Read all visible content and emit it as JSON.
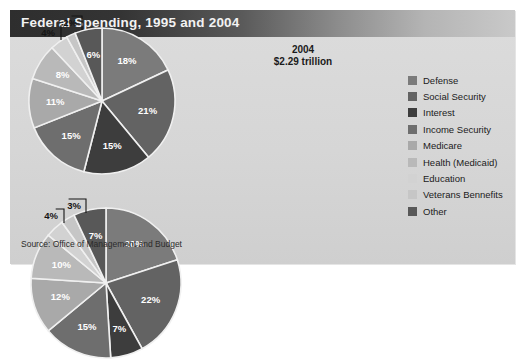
{
  "title": "Federal Spending, 1995 and 2004",
  "source": "Source: Office of Management and Budget",
  "legend": {
    "items": [
      {
        "label": "Defense",
        "color": "#7b7b7b"
      },
      {
        "label": "Social Security",
        "color": "#636363"
      },
      {
        "label": "Interest",
        "color": "#3d3d3d"
      },
      {
        "label": "Income Security",
        "color": "#6e6e6e"
      },
      {
        "label": "Medicare",
        "color": "#a9a9a9"
      },
      {
        "label": "Health (Medicaid)",
        "color": "#b9b9b9"
      },
      {
        "label": "Education",
        "color": "#d2d2d2"
      },
      {
        "label": "Veterans Bennefits",
        "color": "#c6c6c6"
      },
      {
        "label": "Other",
        "color": "#585858"
      }
    ]
  },
  "charts": {
    "pie_1995": {
      "year": "1995",
      "total": "$1.51 trillion",
      "center_x": 92,
      "center_y": 91,
      "radius": 73
    },
    "pie_2004": {
      "year": "2004",
      "total": "$2.29 trillion",
      "center_x": 96,
      "center_y": 98,
      "radius": 75
    }
  },
  "chart_data": [
    {
      "type": "pie",
      "title": "1995",
      "subtitle": "$1.51 trillion",
      "total_label": "$1.51 trillion",
      "unit": "percent of federal spending",
      "start_angle": 0,
      "direction": "clockwise",
      "categories": [
        "Defense",
        "Social Security",
        "Interest",
        "Income Security",
        "Medicare",
        "Health (Medicaid)",
        "Education",
        "Veterans Bennefits",
        "Other"
      ],
      "values": [
        18,
        21,
        15,
        15,
        11,
        8,
        4,
        2,
        6
      ],
      "labels": [
        "18%",
        "21%",
        "15%",
        "15%",
        "11%",
        "8%",
        "4%",
        "2%",
        "6%"
      ],
      "colors": [
        "#7b7b7b",
        "#636363",
        "#3d3d3d",
        "#6e6e6e",
        "#a9a9a9",
        "#b9b9b9",
        "#d2d2d2",
        "#c6c6c6",
        "#585858"
      ],
      "label_placement": [
        "inside",
        "inside",
        "inside",
        "inside",
        "inside",
        "inside",
        "outside",
        "outside",
        "inside"
      ]
    },
    {
      "type": "pie",
      "title": "2004",
      "subtitle": "$2.29 trillion",
      "total_label": "$2.29 trillion",
      "unit": "percent of federal spending",
      "start_angle": 0,
      "direction": "clockwise",
      "categories": [
        "Defense",
        "Social Security",
        "Interest",
        "Income Security",
        "Medicare",
        "Health (Medicaid)",
        "Education",
        "Veterans Bennefits",
        "Other"
      ],
      "values": [
        20,
        22,
        7,
        15,
        12,
        10,
        4,
        3,
        7
      ],
      "labels": [
        "20%",
        "22%",
        "7%",
        "15%",
        "12%",
        "10%",
        "4%",
        "3%",
        "7%"
      ],
      "colors": [
        "#7b7b7b",
        "#636363",
        "#3d3d3d",
        "#6e6e6e",
        "#a9a9a9",
        "#b9b9b9",
        "#d2d2d2",
        "#c6c6c6",
        "#585858"
      ],
      "label_placement": [
        "inside",
        "inside",
        "inside",
        "inside",
        "inside",
        "inside",
        "outside",
        "outside",
        "inside"
      ]
    }
  ]
}
